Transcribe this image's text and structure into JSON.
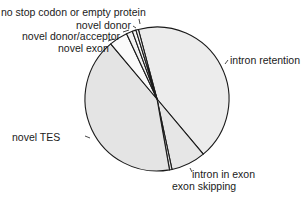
{
  "chart_data": {
    "type": "pie",
    "title": "",
    "colors": {
      "fill_light": "#ececec",
      "fill_white": "#fafafa",
      "stroke": "#1a1a1a"
    },
    "slices": [
      {
        "label": "intron retention",
        "value": 43.0,
        "start_deg": -15,
        "end_deg": 140,
        "fill": "#ececec"
      },
      {
        "label": "intron in exon",
        "value": 7.8,
        "start_deg": 140,
        "end_deg": 168,
        "fill": "#e6e6e6"
      },
      {
        "label": "exon skipping",
        "value": 0.6,
        "start_deg": 168,
        "end_deg": 170,
        "fill": "#e0e0e0"
      },
      {
        "label": "novel TES",
        "value": 41.6,
        "start_deg": 170,
        "end_deg": 320,
        "fill": "#e4e4e4"
      },
      {
        "label": "novel exon",
        "value": 4.2,
        "start_deg": 320,
        "end_deg": 335,
        "fill": "#fafafa"
      },
      {
        "label": "novel donor/acceptor",
        "value": 1.4,
        "start_deg": 335,
        "end_deg": 340,
        "fill": "#f2f2f2"
      },
      {
        "label": "novel donor",
        "value": 0.8,
        "start_deg": 340,
        "end_deg": 343,
        "fill": "#f6f6f6"
      },
      {
        "label": "no stop codon or empty protein",
        "value": 0.6,
        "start_deg": 343,
        "end_deg": 345,
        "fill": "#f0f0f0"
      }
    ],
    "legend": "none (direct labels with leader lines)"
  },
  "labels": {
    "no_stop": "no stop codon or empty protein",
    "novel_donor": "novel donor",
    "novel_donor_acceptor": "novel donor/acceptor",
    "novel_exon": "novel exon",
    "intron_retention": "intron retention",
    "novel_tes": "novel TES",
    "intron_in_exon": "intron in exon",
    "exon_skipping": "exon skipping"
  }
}
